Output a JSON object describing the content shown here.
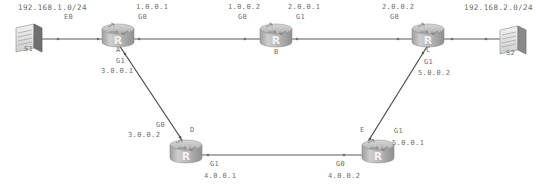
{
  "diagram": {
    "background_color": "#ffffff",
    "line_color": "#555555",
    "text_color": "#6e6e6e",
    "device_fill": "#b9b9b9"
  },
  "networks": [
    {
      "id": "net-left",
      "label": "192.168.1.0/24",
      "x": 18,
      "y": 4
    },
    {
      "id": "net-right",
      "label": "192.168.2.0/24",
      "x": 465,
      "y": 4
    }
  ],
  "switches": [
    {
      "id": "S1",
      "label": "S1",
      "icon": "switch-icon",
      "x": 16,
      "y": 26,
      "label_x": 24,
      "label_y": 48
    },
    {
      "id": "S2",
      "label": "S2",
      "icon": "switch-icon",
      "x": 496,
      "y": 26,
      "label_x": 506,
      "label_y": 50
    }
  ],
  "routers": [
    {
      "id": "A",
      "label": "A",
      "icon": "router-icon",
      "x": 102,
      "y": 24,
      "label_x": 119,
      "label_y": 50
    },
    {
      "id": "B",
      "label": "B",
      "icon": "router-icon",
      "x": 260,
      "y": 24,
      "label_x": 276,
      "label_y": 51
    },
    {
      "id": "C",
      "label": "C",
      "icon": "router-icon",
      "x": 412,
      "y": 24,
      "label_x": 428,
      "label_y": 50
    },
    {
      "id": "D",
      "label": "D",
      "icon": "router-icon",
      "x": 172,
      "y": 140,
      "label_x": 192,
      "label_y": 131
    },
    {
      "id": "E",
      "label": "E",
      "icon": "router-icon",
      "x": 358,
      "y": 140,
      "label_x": 362,
      "label_y": 131
    }
  ],
  "links": [
    {
      "id": "link-s1-a",
      "from": "S1",
      "to": "A",
      "x1": 42,
      "y1": 39,
      "x2": 104,
      "y2": 39
    },
    {
      "id": "link-a-b",
      "from": "A",
      "to": "B",
      "x1": 132,
      "y1": 39,
      "x2": 262,
      "y2": 39
    },
    {
      "id": "link-b-c",
      "from": "B",
      "to": "C",
      "x1": 290,
      "y1": 39,
      "x2": 414,
      "y2": 39
    },
    {
      "id": "link-c-s2",
      "from": "C",
      "to": "S2",
      "x1": 442,
      "y1": 39,
      "x2": 498,
      "y2": 39
    },
    {
      "id": "link-a-d",
      "from": "A",
      "to": "D",
      "x1": 118,
      "y1": 47,
      "x2": 184,
      "y2": 147
    },
    {
      "id": "link-c-e",
      "from": "C",
      "to": "E",
      "x1": 428,
      "y1": 47,
      "x2": 366,
      "y2": 147
    },
    {
      "id": "link-d-e",
      "from": "D",
      "to": "E",
      "x1": 202,
      "y1": 155,
      "x2": 360,
      "y2": 155
    }
  ],
  "interfaces": [
    {
      "id": "if-a-e0",
      "router": "A",
      "name": "E0",
      "x": 66,
      "y": 17
    },
    {
      "id": "if-a-g0",
      "router": "A",
      "name": "G0",
      "ip": "1.0.0.1",
      "ip_x": 139,
      "ip_y": 5,
      "x": 139,
      "y": 17
    },
    {
      "id": "if-b-g0",
      "router": "B",
      "name": "G0",
      "ip": "1.0.0.2",
      "ip_x": 232,
      "ip_y": 5,
      "x": 240,
      "y": 17
    },
    {
      "id": "if-b-g1",
      "router": "B",
      "name": "G1",
      "ip": "2.0.0.1",
      "ip_x": 291,
      "ip_y": 5,
      "x": 297,
      "y": 17
    },
    {
      "id": "if-c-g0",
      "router": "C",
      "name": "G0",
      "ip": "2.0.0.2",
      "ip_x": 385,
      "ip_y": 5,
      "x": 392,
      "y": 17
    },
    {
      "id": "if-a-g1",
      "router": "A",
      "name": "G1",
      "ip": "3.0.0.1",
      "ip_x": 104,
      "ip_y": 70,
      "x": 118,
      "y": 60
    },
    {
      "id": "if-c-g1",
      "router": "C",
      "name": "G1",
      "ip": "5.0.0.2",
      "ip_x": 426,
      "ip_y": 72,
      "x": 426,
      "y": 61
    },
    {
      "id": "if-d-g0",
      "router": "D",
      "name": "G0",
      "ip": "3.0.0.2",
      "ip_x": 130,
      "ip_y": 134,
      "x": 155,
      "y": 124
    },
    {
      "id": "if-d-g1",
      "router": "D",
      "name": "G1",
      "ip": "4.0.0.1",
      "ip_x": 206,
      "ip_y": 175,
      "x": 212,
      "y": 163
    },
    {
      "id": "if-e-g0",
      "router": "E",
      "name": "G0",
      "ip": "4.0.0.2",
      "ip_x": 330,
      "ip_y": 175,
      "x": 337,
      "y": 163
    },
    {
      "id": "if-e-g1",
      "router": "E",
      "name": "G1",
      "ip": "5.0.0.1",
      "ip_x": 394,
      "ip_y": 151,
      "x": 394,
      "y": 139
    }
  ]
}
